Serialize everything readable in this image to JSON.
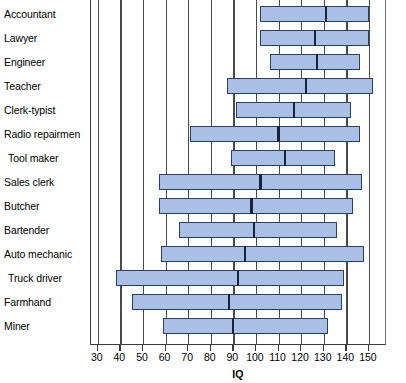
{
  "chart_data": {
    "type": "bar",
    "subtype": "range-bar-with-median",
    "title": "",
    "xlabel": "IQ",
    "ylabel": "",
    "xlim": [
      27,
      158
    ],
    "xticks": [
      30,
      40,
      50,
      60,
      70,
      80,
      90,
      100,
      110,
      120,
      130,
      140,
      150
    ],
    "xtick_labels": [
      "30",
      "40",
      "50",
      "60",
      "70",
      "80",
      "90",
      "100",
      "110",
      "120",
      "130",
      "140",
      "150"
    ],
    "grid": "vertical",
    "legend": "none",
    "categories": [
      "Accountant",
      "Lawyer",
      "Engineer",
      "Teacher",
      "Clerk-typist",
      "Radio repairmen",
      "Tool maker",
      "Sales clerk",
      "Butcher",
      "Bartender",
      "Auto mechanic",
      "Truck driver",
      "Farmhand",
      "Miner"
    ],
    "series": [
      {
        "name": "IQ range",
        "low": [
          102,
          102,
          106,
          87,
          91,
          71,
          89,
          57,
          57,
          66,
          58,
          38,
          45,
          59
        ],
        "high": [
          150,
          150,
          146,
          152,
          142,
          146,
          135,
          147,
          143,
          136,
          148,
          139,
          138,
          132
        ],
        "median": [
          131,
          126,
          127,
          122,
          117,
          110,
          113,
          102,
          98,
          99,
          95,
          92,
          88,
          90
        ]
      }
    ],
    "bar_fill_color": "#a9c0e4",
    "bar_edge_color": "#2b3f66",
    "median_color": "#16233d",
    "grid_color": "#4a4a4a",
    "background_color": "#ffffff"
  },
  "axis": {
    "x_title": "IQ"
  }
}
